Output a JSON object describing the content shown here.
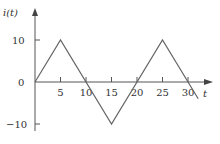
{
  "chart_data": {
    "type": "line",
    "title": "",
    "xlabel": "t",
    "ylabel": "i(t)",
    "x": [
      0,
      5,
      15,
      25,
      32
    ],
    "series": [
      {
        "name": "i(t)",
        "values": [
          0,
          10,
          -10,
          10,
          -4
        ]
      }
    ],
    "xticks": [
      5,
      10,
      15,
      20,
      25,
      30
    ],
    "xtick_labels": [
      "5",
      "10",
      "15",
      "20",
      "25",
      "30"
    ],
    "yticks": [
      10,
      0,
      -10
    ],
    "ytick_labels": [
      "10",
      "0",
      "−10"
    ],
    "xlim": [
      0,
      34
    ],
    "ylim": [
      -12,
      14
    ],
    "grid": false,
    "legend": null,
    "waveform": "triangular",
    "period": 20,
    "amplitude": 10,
    "colors": {
      "line": "#666666",
      "axis": "#555555",
      "text": "#333333"
    }
  }
}
